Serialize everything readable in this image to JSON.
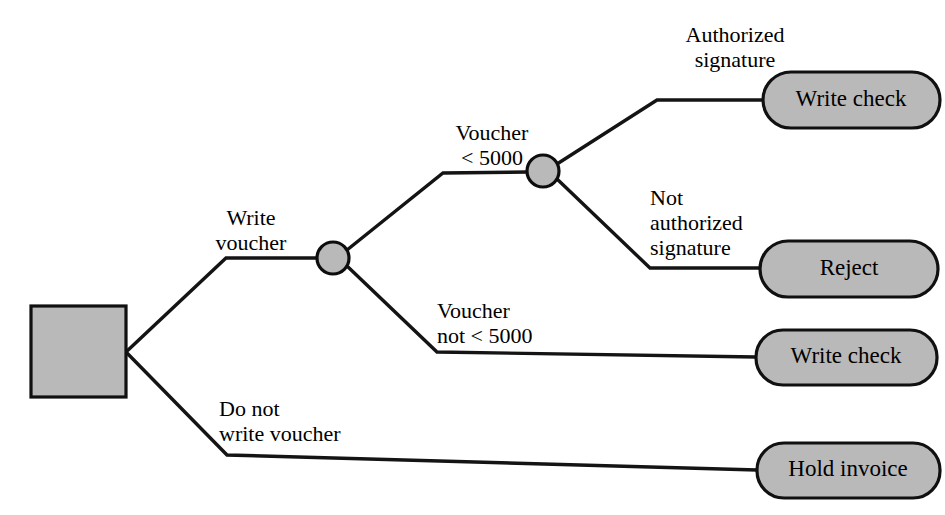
{
  "diagram": {
    "type": "decision-tree",
    "colors": {
      "node_fill": "#b9b9b9",
      "node_stroke": "#101010",
      "line": "#141414",
      "background": "#ffffff"
    },
    "root": {
      "name": "root-decision-square",
      "label": ""
    },
    "decision_nodes": [
      {
        "name": "decision-voucher-amount",
        "label": ""
      },
      {
        "name": "decision-signature",
        "label": ""
      }
    ],
    "edge_labels": [
      {
        "name": "edge-label-write-voucher",
        "text": "Write\nvoucher",
        "align": "center"
      },
      {
        "name": "edge-label-do-not-write-voucher",
        "text": "Do not\nwrite voucher",
        "align": "left"
      },
      {
        "name": "edge-label-voucher-less-than",
        "text": "Voucher\n< 5000",
        "align": "center"
      },
      {
        "name": "edge-label-voucher-not-less-than",
        "text": "Voucher\nnot  < 5000",
        "align": "left"
      },
      {
        "name": "edge-label-authorized-signature",
        "text": "Authorized\nsignature",
        "align": "center"
      },
      {
        "name": "edge-label-not-authorized-signature",
        "text": "Not\nauthorized\nsignature",
        "align": "left"
      }
    ],
    "outcomes": [
      {
        "name": "outcome-write-check-authorized",
        "label": "Write check"
      },
      {
        "name": "outcome-reject",
        "label": "Reject"
      },
      {
        "name": "outcome-write-check-large-voucher",
        "label": "Write check"
      },
      {
        "name": "outcome-hold-invoice",
        "label": "Hold invoice"
      }
    ]
  }
}
